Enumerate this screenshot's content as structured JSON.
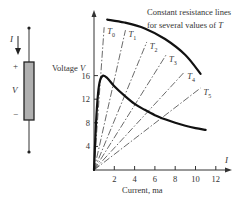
{
  "figure": {
    "component": {
      "current_label": "I",
      "plus_label": "+",
      "voltage_label": "V",
      "minus_label": "−",
      "body_color": "#b0b0b0"
    },
    "annotation_line1": "Constant resistance lines",
    "annotation_line2_prefix": "for several values of ",
    "annotation_line2_var": "T"
  },
  "chart_data": {
    "type": "line",
    "title": "",
    "xlabel": "Current, ma",
    "x_axis_symbol": "I",
    "ylabel": "Voltage V",
    "ylabel_text": "Voltage",
    "ylabel_var": "V",
    "xlim": [
      0,
      13
    ],
    "ylim": [
      0,
      27
    ],
    "x_ticks": [
      2,
      4,
      6,
      8,
      10,
      12
    ],
    "y_ticks": [
      4,
      8,
      12,
      16
    ],
    "grid": false,
    "series": [
      {
        "name": "V-I characteristic",
        "style": "solid-thick",
        "points": [
          [
            0,
            0
          ],
          [
            0.2,
            8
          ],
          [
            0.4,
            13
          ],
          [
            0.6,
            15.2
          ],
          [
            0.9,
            16
          ],
          [
            1.3,
            15.6
          ],
          [
            2,
            14.2
          ],
          [
            3,
            12.6
          ],
          [
            4,
            11.2
          ],
          [
            5,
            10.2
          ],
          [
            6,
            9.3
          ],
          [
            7,
            8.6
          ],
          [
            8,
            8.0
          ],
          [
            9,
            7.5
          ],
          [
            10,
            7.1
          ],
          [
            11,
            6.8
          ]
        ]
      },
      {
        "name": "Envelope",
        "style": "solid-thick",
        "points": [
          [
            1.3,
            25.5
          ],
          [
            3,
            25
          ],
          [
            5,
            24
          ],
          [
            7,
            22.2
          ],
          [
            9,
            19.5
          ],
          [
            10.5,
            16.3
          ]
        ]
      }
    ],
    "resistance_lines": [
      {
        "label": "T",
        "subscript": "0",
        "end": [
          1.0,
          24.2
        ]
      },
      {
        "label": "T",
        "subscript": "1",
        "end": [
          3.1,
          23.7
        ]
      },
      {
        "label": "T",
        "subscript": "2",
        "end": [
          5.2,
          21.7
        ]
      },
      {
        "label": "T",
        "subscript": "3",
        "end": [
          7.1,
          19.5
        ]
      },
      {
        "label": "T",
        "subscript": "4",
        "end": [
          8.9,
          16.6
        ]
      },
      {
        "label": "T",
        "subscript": "5",
        "end": [
          10.5,
          13.9
        ]
      }
    ]
  }
}
